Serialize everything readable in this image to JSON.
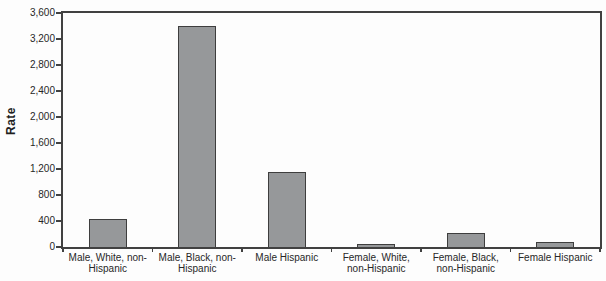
{
  "chart_data": {
    "type": "bar",
    "title": "",
    "xlabel": "",
    "ylabel": "Rate",
    "categories": [
      "Male, White, non-\nHispanic",
      "Male, Black, non-\nHispanic",
      "Male Hispanic",
      "Female, White,\nnon-Hispanic",
      "Female, Black,\nnon-Hispanic",
      "Female Hispanic"
    ],
    "values": [
      430,
      3400,
      1150,
      40,
      210,
      80
    ],
    "ylim": [
      0,
      3600
    ],
    "yticks": [
      0,
      400,
      800,
      1200,
      1600,
      2000,
      2400,
      2800,
      3200,
      3600
    ],
    "ytick_labels": [
      "0",
      "400",
      "800",
      "1,200",
      "1,600",
      "2,000",
      "2,400",
      "2,800",
      "3,200",
      "3,600"
    ],
    "grid": false,
    "legend": null,
    "colors": {
      "bar_fill": "#96989a",
      "bar_border": "#3e3e3e",
      "axis": "#414141",
      "text": "#272727",
      "background": "#fdfdfd"
    }
  }
}
